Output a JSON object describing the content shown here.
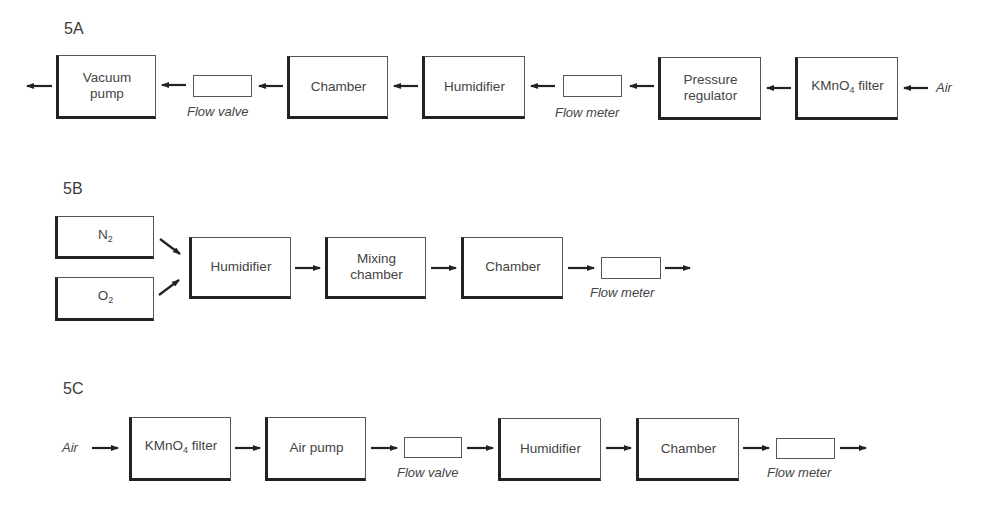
{
  "figure": {
    "panels": [
      {
        "id": "5A",
        "label": "5A",
        "direction": "right-to-left",
        "input": "Air",
        "components": [
          {
            "name": "KMnO4 filter",
            "text": "KMnO",
            "sub": "4",
            "suffix": " filter"
          },
          {
            "name": "Pressure regulator",
            "line1": "Pressure",
            "line2": "regulator"
          },
          {
            "name": "Flow meter",
            "caption": "Flow meter"
          },
          {
            "name": "Humidifier",
            "text": "Humidifier"
          },
          {
            "name": "Chamber",
            "text": "Chamber"
          },
          {
            "name": "Flow valve",
            "caption": "Flow valve"
          },
          {
            "name": "Vacuum pump",
            "line1": "Vacuum",
            "line2": "pump"
          }
        ]
      },
      {
        "id": "5B",
        "label": "5B",
        "direction": "left-to-right",
        "sources": [
          {
            "text": "N",
            "sub": "2"
          },
          {
            "text": "O",
            "sub": "2"
          }
        ],
        "components": [
          {
            "name": "Humidifier",
            "text": "Humidifier"
          },
          {
            "name": "Mixing chamber",
            "line1": "Mixing",
            "line2": "chamber"
          },
          {
            "name": "Chamber",
            "text": "Chamber"
          },
          {
            "name": "Flow meter",
            "caption": "Flow meter"
          }
        ]
      },
      {
        "id": "5C",
        "label": "5C",
        "direction": "left-to-right",
        "input": "Air",
        "components": [
          {
            "name": "KMnO4 filter",
            "text": "KMnO",
            "sub": "4",
            "suffix": " filter"
          },
          {
            "name": "Air pump",
            "text": "Air pump"
          },
          {
            "name": "Flow valve",
            "caption": "Flow valve"
          },
          {
            "name": "Humidifier",
            "text": "Humidifier"
          },
          {
            "name": "Chamber",
            "text": "Chamber"
          },
          {
            "name": "Flow meter",
            "caption": "Flow meter"
          }
        ]
      }
    ]
  }
}
